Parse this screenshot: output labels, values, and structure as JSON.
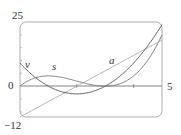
{
  "chart_data": {
    "type": "line",
    "title": "",
    "xlabel": "",
    "ylabel": "",
    "xlim": [
      0,
      5
    ],
    "ylim": [
      -12,
      25
    ],
    "grid": false,
    "x_tick_labels": [
      "0",
      "5"
    ],
    "y_tick_labels": [
      "25",
      "0",
      "-12"
    ],
    "x": [
      0,
      0.5,
      1,
      1.5,
      2,
      2.5,
      3,
      3.5,
      4,
      4.5,
      5
    ],
    "series": [
      {
        "name": "s",
        "values": [
          0,
          3.125,
          4,
          3.375,
          2,
          0.625,
          0,
          0.875,
          4,
          10.125,
          20
        ]
      },
      {
        "name": "v",
        "values": [
          9,
          3.75,
          0,
          -2.25,
          -3,
          -2.25,
          0,
          3.75,
          9,
          15.75,
          24
        ]
      },
      {
        "name": "a",
        "values": [
          -12,
          -9,
          -6,
          -3,
          0,
          3,
          6,
          9,
          12,
          15,
          18
        ]
      }
    ],
    "annotations": [
      "s",
      "v",
      "a"
    ]
  },
  "labels": {
    "y_top": "25",
    "y_zero": "0",
    "y_bottom": "−12",
    "x_right": "5",
    "curve_s": "s",
    "curve_v": "v",
    "curve_a": "a"
  }
}
